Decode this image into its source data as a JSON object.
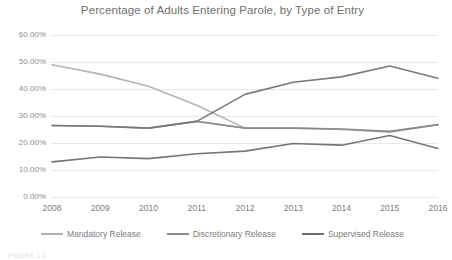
{
  "chart_data": {
    "type": "line",
    "title": "Percentage of Adults Entering Parole, by Type of Entry",
    "xlabel": "",
    "ylabel": "",
    "categories": [
      "2008",
      "2009",
      "2010",
      "2011",
      "2012",
      "2013",
      "2014",
      "2015",
      "2016"
    ],
    "x": [
      2008,
      2009,
      2010,
      2011,
      2012,
      2013,
      2014,
      2015,
      2016
    ],
    "ylim": [
      0,
      60
    ],
    "yticks": [
      0,
      10,
      20,
      30,
      40,
      50,
      60
    ],
    "ytick_labels": [
      "0.00%",
      "10.00%",
      "20.00%",
      "30.00%",
      "40.00%",
      "50.00%",
      "60.00%"
    ],
    "y_unit": "percent",
    "grid": true,
    "grid_axis": "y",
    "legend_position": "bottom",
    "series": [
      {
        "name": "Mandatory Release",
        "color": "#b4b4b4",
        "values": [
          49.0,
          45.5,
          41.0,
          34.0,
          25.5,
          25.5,
          25.0,
          24.0,
          26.8
        ]
      },
      {
        "name": "Discretionary Release",
        "color": "#8a8a8a",
        "values": [
          26.5,
          26.2,
          25.5,
          28.0,
          25.5,
          25.5,
          25.2,
          24.3,
          26.8
        ]
      },
      {
        "name": "Supervised Release",
        "color": "#767676",
        "values": [
          13.0,
          14.8,
          14.2,
          16.0,
          17.0,
          19.8,
          19.2,
          22.8,
          18.0
        ]
      },
      {
        "name": "Supervised Release Upper",
        "color": "#7a7a7a",
        "values": [
          26.5,
          26.2,
          25.5,
          28.0,
          38.0,
          42.5,
          44.5,
          48.5,
          44.0
        ]
      }
    ]
  },
  "legend": {
    "items": [
      {
        "label": "Mandatory Release",
        "color": "#b4b4b4"
      },
      {
        "label": "Discretionary Release",
        "color": "#8a8a8a"
      },
      {
        "label": "Supervised Release",
        "color": "#6f6f6f"
      }
    ]
  },
  "caption": {
    "text": "FIGURE 1.1"
  }
}
